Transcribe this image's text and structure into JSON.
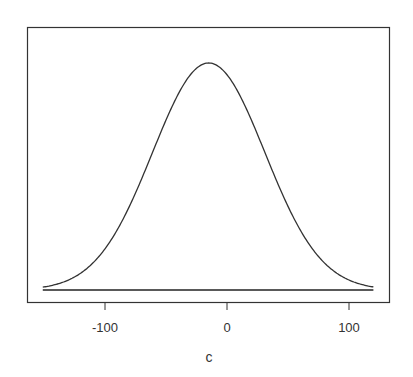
{
  "chart_data": {
    "type": "line",
    "title": "",
    "xlabel": "c",
    "ylabel": "",
    "xlim": [
      -163,
      133
    ],
    "x_ticks": [
      -100,
      0,
      100
    ],
    "x_tick_labels": [
      "-100",
      "0",
      "100"
    ],
    "y_ticks": [],
    "grid": false,
    "legend": null,
    "curve": {
      "distribution": "normal",
      "mean": -15,
      "sd": 46,
      "x_min": -151,
      "x_max": 120
    },
    "series": [
      {
        "name": "density",
        "x": [
          -151,
          -140,
          -130,
          -120,
          -110,
          -100,
          -90,
          -80,
          -70,
          -60,
          -50,
          -40,
          -30,
          -20,
          -15,
          -10,
          0,
          10,
          20,
          30,
          40,
          50,
          60,
          70,
          80,
          90,
          100,
          110,
          120
        ],
        "y_relative": [
          0.013,
          0.025,
          0.042,
          0.074,
          0.119,
          0.181,
          0.265,
          0.369,
          0.491,
          0.617,
          0.74,
          0.862,
          0.938,
          0.994,
          1.0,
          0.994,
          0.948,
          0.863,
          0.748,
          0.618,
          0.486,
          0.366,
          0.263,
          0.181,
          0.119,
          0.074,
          0.044,
          0.025,
          0.013
        ]
      }
    ],
    "baseline": {
      "x_from": -151,
      "x_to": 120,
      "y": 0
    }
  },
  "axis": {
    "x_label": "c",
    "ticks": [
      "-100",
      "0",
      "100"
    ]
  }
}
